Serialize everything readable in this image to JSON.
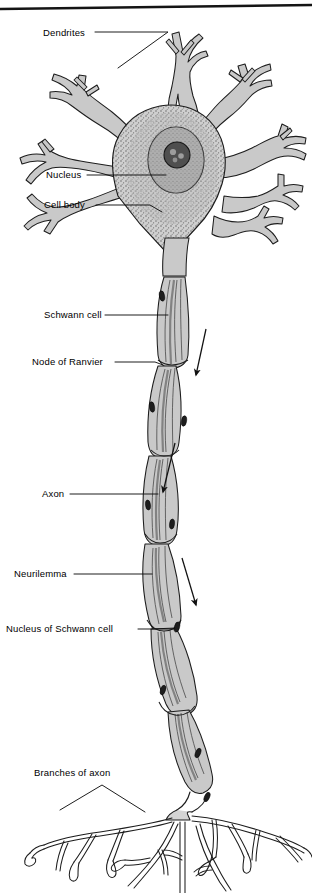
{
  "figure": {
    "width": 312,
    "height": 893,
    "background_color": "#ffffff",
    "ink_color": "#1a1a1a",
    "fill_gray": "#c9c9c9",
    "nucleus_gray": "#8d8d8d",
    "nucleolus_gray": "#4a4a4a",
    "top_border_color": "#141414"
  },
  "labels": {
    "dendrites": "Dendrites",
    "nucleus": "Nucleus",
    "cell_body": "Cell body",
    "schwann_cell": "Schwann cell",
    "node_of_ranvier": "Node of Ranvier",
    "axon": "Axon",
    "neurilemma": "Neurilemma",
    "nucleus_of_schwann_cell": "Nucleus of Schwann cell",
    "branches_of_axon": "Branches of axon"
  },
  "parts": [
    {
      "id": "dendrites",
      "name": "Dendrites",
      "label_x": 43,
      "label_y": 28
    },
    {
      "id": "nucleus",
      "name": "Nucleus",
      "label_x": 46,
      "label_y": 170
    },
    {
      "id": "cell-body",
      "name": "Cell body",
      "label_x": 44,
      "label_y": 200
    },
    {
      "id": "schwann-cell",
      "name": "Schwann cell",
      "label_x": 44,
      "label_y": 310
    },
    {
      "id": "node-of-ranvier",
      "name": "Node of Ranvier",
      "label_x": 32,
      "label_y": 357
    },
    {
      "id": "axon",
      "name": "Axon",
      "label_x": 42,
      "label_y": 489
    },
    {
      "id": "neurilemma",
      "name": "Neurilemma",
      "label_x": 14,
      "label_y": 569
    },
    {
      "id": "nucleus-of-schwann-cell",
      "name": "Nucleus of Schwann cell",
      "label_x": 6,
      "label_y": 624
    },
    {
      "id": "branches-of-axon",
      "name": "Branches of axon",
      "label_x": 34,
      "label_y": 768
    }
  ],
  "impulse_arrows": {
    "count": 3,
    "direction": "downward",
    "meaning": "direction of nerve impulse"
  }
}
